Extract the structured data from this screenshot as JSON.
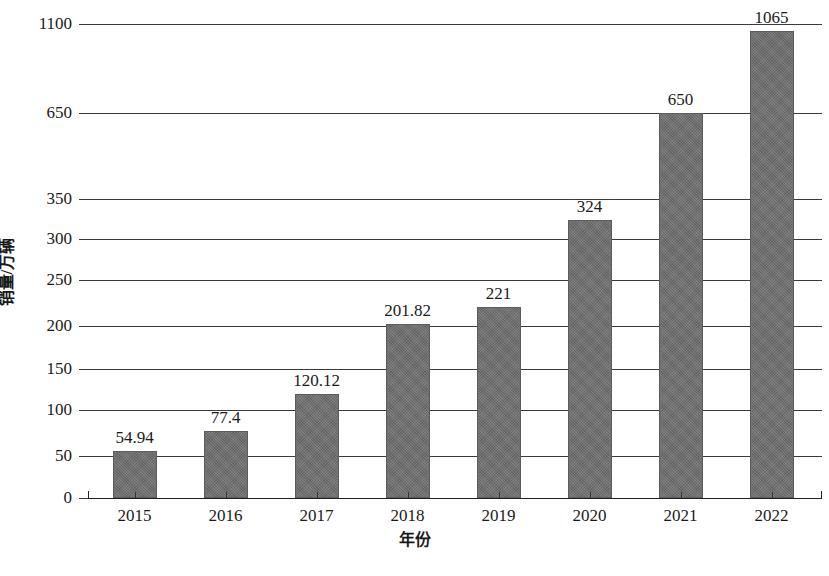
{
  "chart_data": {
    "type": "bar",
    "title": "",
    "xlabel": "年份",
    "ylabel": "销量/万辆",
    "categories": [
      "2015",
      "2016",
      "2017",
      "2018",
      "2019",
      "2020",
      "2021",
      "2022"
    ],
    "values": [
      54.94,
      77.4,
      120.12,
      201.82,
      221,
      324,
      650,
      1065
    ],
    "value_labels": [
      "54.94",
      "77.4",
      "120.12",
      "201.82",
      "221",
      "324",
      "650",
      "1065"
    ],
    "ytick_labels": [
      "0",
      "50",
      "100",
      "150",
      "200",
      "250",
      "300",
      "350",
      "650",
      "1100"
    ],
    "ytick_values": [
      0,
      50,
      100,
      150,
      200,
      250,
      300,
      350,
      650,
      1100
    ],
    "ytick_pixels": [
      498,
      456,
      410,
      369,
      326,
      280,
      239,
      199,
      113,
      24
    ],
    "ylim": [
      0,
      1100
    ],
    "axis_note": "broken non-linear y-axis: linear 0-350 then compressed 350-650-1100",
    "grid": true,
    "legend": false,
    "legend_position": "none",
    "bar_color": "#6f6f6f",
    "axis_color": "#333333",
    "text_color": "#1a1a1a",
    "series": [
      {
        "name": "销量",
        "values": [
          54.94,
          77.4,
          120.12,
          201.82,
          221,
          324,
          650,
          1065
        ]
      }
    ]
  },
  "figure": {
    "caption": ""
  }
}
